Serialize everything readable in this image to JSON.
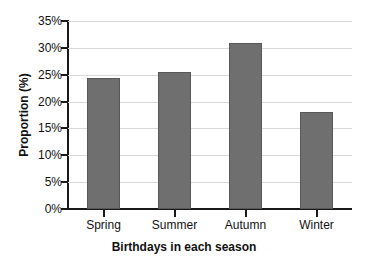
{
  "chart_data": {
    "type": "bar",
    "title": "",
    "categories": [
      "Spring",
      "Summer",
      "Autumn",
      "Winter"
    ],
    "values": [
      24.3,
      25.5,
      31.0,
      18.0
    ],
    "xlabel": "Birthdays in each season",
    "ylabel": "Proportion (%)",
    "ylim": [
      0,
      35
    ],
    "ytick_labels": [
      "0%",
      "5%",
      "10%",
      "15%",
      "20%",
      "25%",
      "30%",
      "35%"
    ],
    "ytick_values": [
      0,
      5,
      10,
      15,
      20,
      25,
      30,
      35
    ],
    "grid": true,
    "legend": false,
    "bar_color": "#706f6f",
    "bar_edge_color": "#595858",
    "grid_color": "#d8d8d8",
    "axis_color": "#1a1a1a",
    "background": "#ffffff"
  }
}
